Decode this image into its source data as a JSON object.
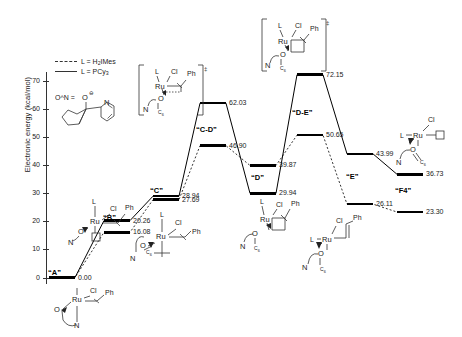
{
  "figure": {
    "y_axis_title": "Electronic energy (kcal/mol)",
    "y_ticks": [
      0,
      10,
      20,
      30,
      40,
      50,
      60,
      70
    ],
    "ylim": [
      -3,
      75
    ]
  },
  "legend": {
    "position": "top-left",
    "entries": [
      {
        "label_prefix": "L = ",
        "label_main": "H",
        "sub1": "2",
        "label_tail": "IMes",
        "style": "dashed",
        "full": "L = H2IMes"
      },
      {
        "label_prefix": "L = ",
        "label_main": "PCy",
        "sub1": "3",
        "label_tail": "",
        "style": "solid",
        "full": "L = PCy3"
      }
    ]
  },
  "ligand_definition": {
    "text": "O^N =",
    "charge": "⊖",
    "atoms": [
      "O",
      "N"
    ]
  },
  "chart_data": {
    "type": "line",
    "title": "",
    "xlabel": "",
    "ylabel": "Electronic energy (kcal/mol)",
    "ylim": [
      -3,
      75
    ],
    "grid": false,
    "legend_position": "top-left",
    "categories": [
      "“A”",
      "“B”",
      "“C”",
      "“C-D”",
      "“D”",
      "“D-E”",
      "“E”",
      "“F4”"
    ],
    "series": [
      {
        "name": "L = PCy3",
        "style": "solid",
        "values": [
          0.0,
          20.26,
          28.94,
          62.03,
          29.94,
          72.15,
          43.99,
          36.73
        ],
        "labels": [
          "0.00",
          "20.26",
          "28.94",
          "62.03",
          "29.94",
          "72.15",
          "43.99",
          "36.73"
        ]
      },
      {
        "name": "L = H2IMes",
        "style": "dashed",
        "values": [
          0.0,
          16.08,
          27.69,
          46.9,
          39.87,
          50.65,
          26.11,
          23.3
        ],
        "labels": [
          "0.00",
          "16.08",
          "27.69",
          "46.90",
          "39.87",
          "50.65",
          "26.11",
          "23.30"
        ]
      }
    ],
    "state_labels": [
      "“A”",
      "“B”",
      "“C”",
      "“C-D”",
      "“D”",
      "“D-E”",
      "“E”",
      "“F4”"
    ]
  },
  "structures": {
    "a": {
      "atoms": [
        "Ru",
        "Cl",
        "Ph",
        "O",
        "N"
      ],
      "ligand": "L",
      "bracket": false
    },
    "b": {
      "atoms": [
        "Ru",
        "Cl",
        "Ph",
        "O",
        "N"
      ],
      "ligand": "L",
      "vacancy": "□",
      "bracket": false
    },
    "c": {
      "atoms": [
        "Ru",
        "Cl",
        "Ph",
        "O",
        "N"
      ],
      "ligand": "L",
      "bracket": false
    },
    "cd_ts": {
      "atoms": [
        "Ru",
        "Cl",
        "Ph",
        "O",
        "N"
      ],
      "ligand": "L",
      "bracket": true,
      "dagger": "‡"
    },
    "d": {
      "atoms": [
        "Ru",
        "Cl",
        "Ph",
        "O",
        "N"
      ],
      "ligand": "L",
      "bracket": false
    },
    "de_ts": {
      "atoms": [
        "Ru",
        "Cl",
        "Ph",
        "O",
        "N"
      ],
      "ligand": "L",
      "bracket": true,
      "dagger": "‡"
    },
    "e": {
      "atoms": [
        "Ru",
        "Cl",
        "Ph",
        "O",
        "N"
      ],
      "ligand": "L",
      "bracket": false
    },
    "f4": {
      "atoms": [
        "Ru",
        "Cl",
        "O",
        "N"
      ],
      "ligand": "L",
      "vacancy": "□",
      "bracket": false
    }
  },
  "colors": {
    "line": "#000000",
    "axis": "#333333",
    "text": "#222222",
    "background": "#ffffff"
  }
}
